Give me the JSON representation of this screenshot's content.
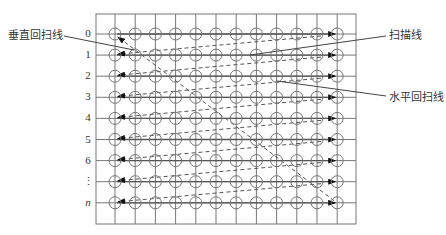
{
  "labels": {
    "vertical_retrace": "垂直回扫线",
    "scan_line": "扫描线",
    "horizontal_retrace": "水平回扫线"
  },
  "rows": [
    "0",
    "1",
    "2",
    "3",
    "4",
    "5",
    "6",
    "⋮",
    "n"
  ],
  "grid": {
    "left": 96,
    "top": 14,
    "right": 356,
    "bottom": 224,
    "col_x0": 115,
    "col_dx": 20.2,
    "cols": 12,
    "row_y0": 34,
    "row_dy": 21.1,
    "circle_r": 6
  },
  "pointers": {
    "vertical_retrace": {
      "x1": 64,
      "y1": 36,
      "x2": 134,
      "y2": 50
    },
    "scan_line": {
      "x1": 386,
      "y1": 36,
      "x2": 250,
      "y2": 55
    },
    "horizontal_retrace": {
      "x1": 386,
      "y1": 96,
      "x2": 277,
      "y2": 81
    }
  },
  "colors": {
    "grid": "#777777",
    "line": "#555555",
    "arrow": "#111111",
    "text": "#333333"
  }
}
